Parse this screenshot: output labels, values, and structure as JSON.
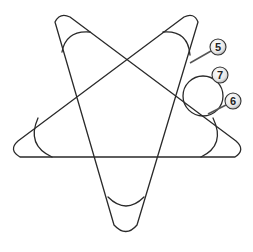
{
  "diagram": {
    "title": "",
    "stroke_color": "#2a2a2a",
    "background": "#ffffff",
    "callouts": [
      {
        "id": "5",
        "label": "5",
        "x": 218,
        "y": 47
      },
      {
        "id": "7",
        "label": "7",
        "x": 220,
        "y": 75
      },
      {
        "id": "6",
        "label": "6",
        "x": 233,
        "y": 101
      }
    ]
  }
}
